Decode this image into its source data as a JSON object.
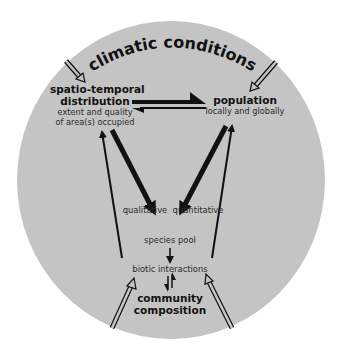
{
  "diagram": {
    "title": "climatic conditions",
    "colors": {
      "background": "#ffffff",
      "circle_fill": "#c4c4c4",
      "arrow": "#111111",
      "text": "#1a1a1a"
    },
    "nodes": {
      "distribution": {
        "title_line1": "spatio-temporal",
        "title_line2": "distribution",
        "sub_line1": "extent and quality",
        "sub_line2": "of area(s) occupied"
      },
      "population": {
        "title": "population",
        "sub": "locally and globally"
      },
      "species_pool": {
        "label": "species pool"
      },
      "biotic_interactions": {
        "label": "biotic interactions"
      },
      "community": {
        "title_line1": "community",
        "title_line2": "composition"
      }
    },
    "edge_labels": {
      "qualitative": "qualitative",
      "quantitative": "quantitative"
    },
    "edges": [
      {
        "from": "climatic conditions",
        "to": "spatio-temporal distribution",
        "style": "hollow"
      },
      {
        "from": "climatic conditions",
        "to": "population",
        "style": "hollow"
      },
      {
        "from": "spatio-temporal distribution",
        "to": "population",
        "style": "thick-half"
      },
      {
        "from": "population",
        "to": "spatio-temporal distribution",
        "style": "thin-half"
      },
      {
        "from": "spatio-temporal distribution",
        "to": "species pool",
        "style": "thick",
        "label": "qualitative"
      },
      {
        "from": "population",
        "to": "species pool",
        "style": "thick",
        "label": "quantitative"
      },
      {
        "from": "biotic interactions",
        "to": "spatio-temporal distribution",
        "style": "thin"
      },
      {
        "from": "biotic interactions",
        "to": "population",
        "style": "thin"
      },
      {
        "from": "species pool",
        "to": "biotic interactions",
        "style": "thin"
      },
      {
        "from": "biotic interactions",
        "to": "community composition",
        "style": "bidirectional-half"
      },
      {
        "from": "outside",
        "to": "biotic interactions",
        "style": "hollow"
      },
      {
        "from": "outside",
        "to": "biotic interactions",
        "style": "hollow"
      }
    ]
  }
}
